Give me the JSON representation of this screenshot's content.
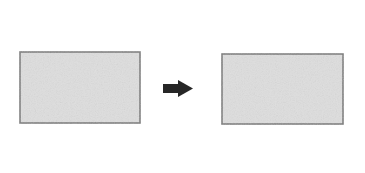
{
  "canvas": {
    "width": 365,
    "height": 173,
    "background": "#ffffff"
  },
  "diagram": {
    "type": "geometry-transformation"
  },
  "colors": {
    "shape_fill": "#dedede",
    "shape_stroke": "#7a7a7a",
    "axis_line": "#8a8a8a",
    "arrow": "#262626",
    "background": "#ffffff"
  },
  "figures": [
    {
      "id": "left-figure",
      "label": "Pre-image rectangle with vertical axis",
      "rect": {
        "x": 20,
        "y": 52,
        "width": 120,
        "height": 71
      },
      "axis": {
        "x": 79.5,
        "y1": 12,
        "y2": 160
      }
    },
    {
      "id": "right-figure",
      "label": "Image rectangle with vertical axis",
      "rect": {
        "x": 222,
        "y": 54,
        "width": 121,
        "height": 70
      },
      "axis": {
        "x": 279.5,
        "y1": 12,
        "y2": 160
      }
    }
  ],
  "arrow": {
    "label": "maps to",
    "shaft": {
      "x": 163,
      "y": 84,
      "width": 18,
      "height": 9
    },
    "head": {
      "points": "178,80 178,97 193,88.5"
    }
  }
}
